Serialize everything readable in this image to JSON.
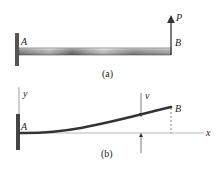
{
  "figure_a": {
    "caption": "(a)",
    "point_A": "A",
    "point_B": "B",
    "load_label": "P"
  },
  "figure_b": {
    "caption": "(b)",
    "point_A": "A",
    "point_B": "B",
    "y_axis_label": "y",
    "x_axis_label": "x",
    "deflection_label": "v"
  },
  "colors": {
    "beam_dark": "#3a3a3a",
    "beam_light": "#d8d8d8",
    "line": "#333333",
    "axis": "#888888"
  }
}
